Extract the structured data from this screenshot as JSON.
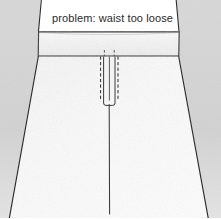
{
  "diagram": {
    "kind": "sewing-technical-illustration",
    "caption": "problem: waist too loose",
    "background_color": "#d4d4d4",
    "garment_fill": "#f7f7f7",
    "line_color": "#2b2b2b",
    "shadow_color": "#c2c2c2",
    "parts": [
      {
        "name": "waistband",
        "label": "waistband"
      },
      {
        "name": "skirt-body",
        "label": "skirt body"
      },
      {
        "name": "center-front-seam",
        "label": "center front seam"
      },
      {
        "name": "placket",
        "label": "placket / zipper"
      },
      {
        "name": "topstitch-left",
        "label": "left topstitch line"
      },
      {
        "name": "topstitch-right",
        "label": "right topstitch line"
      }
    ],
    "annotation": {
      "text": "problem: waist too loose",
      "x": 52,
      "y": 22
    }
  }
}
